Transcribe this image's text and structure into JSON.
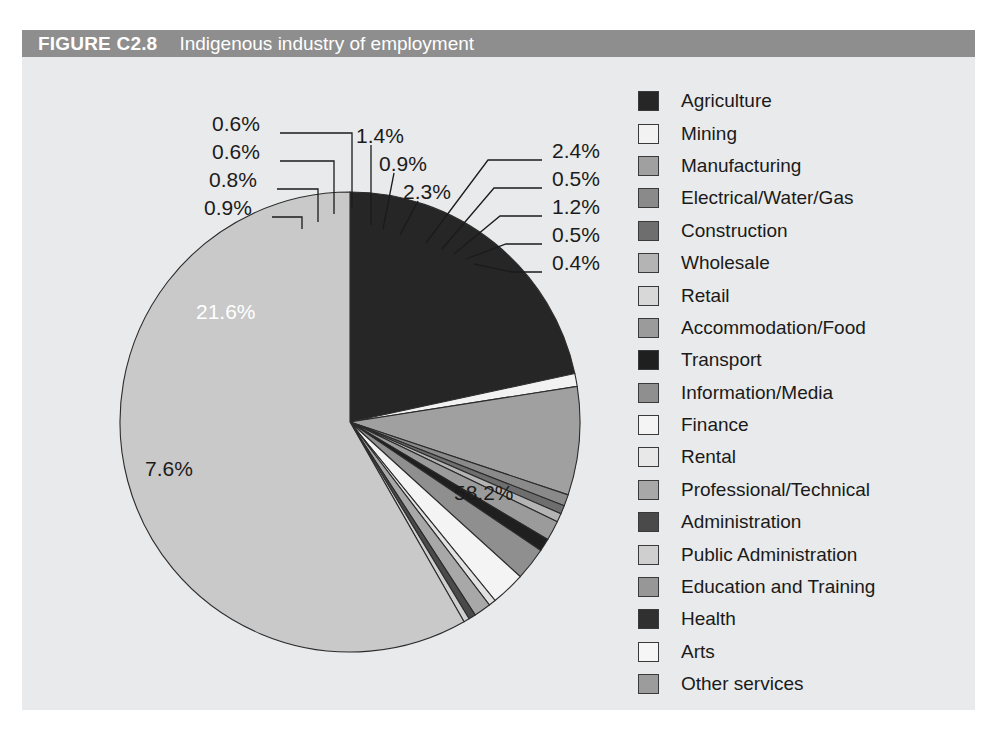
{
  "figure": {
    "number": "FIGURE C2.8",
    "caption": "Indigenous industry of employment",
    "title_bar_color": "#8e8e8e",
    "panel_color": "#e9eaeb"
  },
  "chart_data": {
    "type": "pie",
    "title": "Indigenous industry of employment",
    "xlabel": "",
    "ylabel": "",
    "legend_position": "right",
    "grid": false,
    "start_angle_deg": 0,
    "direction": "clockwise",
    "categories": [
      "Agriculture",
      "Mining",
      "Manufacturing",
      "Electrical/Water/Gas",
      "Construction",
      "Wholesale",
      "Retail",
      "Accommodation/Food",
      "Transport",
      "Information/Media",
      "Finance",
      "Rental",
      "Professional/Technical",
      "Administration",
      "Public Administration",
      "Education and Training",
      "Health",
      "Arts",
      "Other services"
    ],
    "values": [
      21.6,
      0.9,
      7.6,
      0.8,
      0.6,
      0.6,
      58.2,
      1.4,
      0.9,
      2.3,
      2.4,
      0.5,
      1.2,
      0.5,
      0.4,
      0.0,
      0.0,
      0.0,
      0.0
    ],
    "labels": [
      "21.6%",
      "0.9%",
      "7.6%",
      "0.8%",
      "0.6%",
      "0.6%",
      "58.2%",
      "1.4%",
      "0.9%",
      "2.3%",
      "2.4%",
      "0.5%",
      "1.2%",
      "0.5%",
      "0.4%"
    ],
    "colors": [
      "#262626",
      "#f2f2f2",
      "#a0a0a0",
      "#8a8a8a",
      "#6e6e6e",
      "#b4b4b4",
      "#c9c9c9",
      "#9b9b9b",
      "#1f1f1f",
      "#8f8f8f",
      "#f4f4f4",
      "#e2e2e2",
      "#a8a8a8",
      "#4a4a4a",
      "#cfcfcf",
      "#979797",
      "#303030",
      "#f6f6f6",
      "#9c9c9c"
    ]
  },
  "legend": {
    "items": [
      {
        "label": "Agriculture",
        "color": "#262626"
      },
      {
        "label": "Mining",
        "color": "#f2f2f2"
      },
      {
        "label": "Manufacturing",
        "color": "#a0a0a0"
      },
      {
        "label": "Electrical/Water/Gas",
        "color": "#8a8a8a"
      },
      {
        "label": "Construction",
        "color": "#6e6e6e"
      },
      {
        "label": "Wholesale",
        "color": "#b4b4b4"
      },
      {
        "label": "Retail",
        "color": "#d8d8d8"
      },
      {
        "label": "Accommodation/Food",
        "color": "#9b9b9b"
      },
      {
        "label": "Transport",
        "color": "#1f1f1f"
      },
      {
        "label": "Information/Media",
        "color": "#8f8f8f"
      },
      {
        "label": "Finance",
        "color": "#f4f4f4"
      },
      {
        "label": "Rental",
        "color": "#e8e8e8"
      },
      {
        "label": "Professional/Technical",
        "color": "#a8a8a8"
      },
      {
        "label": "Administration",
        "color": "#4a4a4a"
      },
      {
        "label": "Public Administration",
        "color": "#cfcfcf"
      },
      {
        "label": "Education and Training",
        "color": "#979797"
      },
      {
        "label": "Health",
        "color": "#303030"
      },
      {
        "label": "Arts",
        "color": "#f6f6f6"
      },
      {
        "label": "Other services",
        "color": "#9c9c9c"
      }
    ]
  },
  "callouts": {
    "left": [
      "0.6%",
      "0.6%",
      "0.8%",
      "0.9%"
    ],
    "upper_mid": [
      "1.4%",
      "0.9%",
      "2.3%"
    ],
    "right": [
      "2.4%",
      "0.5%",
      "1.2%",
      "0.5%",
      "0.4%"
    ],
    "inside": [
      "21.6%",
      "7.6%",
      "58.2%"
    ]
  }
}
